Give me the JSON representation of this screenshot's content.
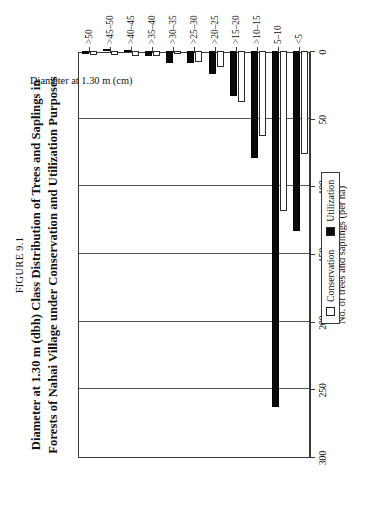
{
  "figure": {
    "number_prefix": "F",
    "number_rest": "IGURE",
    "number_label": "FIGURE 9.1",
    "number_text": "9.1",
    "title_line1": "Diameter at 1.30 m (dbh) Class Distribution of Trees and Saplings in",
    "title_line2": "Forests of Nahai Village under Conservation and Utilization Purposes"
  },
  "legend": {
    "position": "bottom-center",
    "items": [
      {
        "label": "Conservation",
        "color": "#ffffff"
      },
      {
        "label": "Utilization",
        "color": "#0a0a0a"
      }
    ]
  },
  "axes": {
    "value_axis_title": "No. of trees and saplings (per ha)",
    "category_axis_title": "Diameter at 1.30 m (cm)",
    "value_ticks": [
      "0",
      "50",
      "100",
      "150",
      "200",
      "250",
      "300"
    ]
  },
  "chart_data": {
    "type": "bar",
    "orientation": "horizontal",
    "title": "Diameter at 1.30 m (dbh) Class Distribution of Trees and Saplings in Forests of Nahai Village under Conservation and Utilization Purposes",
    "subtitle": "FIGURE 9.1",
    "xlabel": "Diameter at 1.30 m (cm)",
    "ylabel": "No. of trees and saplings (per ha)",
    "ylim": [
      0,
      300
    ],
    "ytick_step": 50,
    "grid": true,
    "legend_entries": [
      "Conservation",
      "Utilization"
    ],
    "categories": [
      "<5",
      "5–10",
      ">10–15",
      ">15–20",
      ">20–25",
      ">25–30",
      ">30–35",
      ">35–40",
      ">40–45",
      ">45–50",
      ">50"
    ],
    "series": [
      {
        "name": "Conservation",
        "color": "#ffffff",
        "values": [
          76,
          118,
          63,
          38,
          12,
          8,
          2,
          4,
          4,
          3,
          3
        ]
      },
      {
        "name": "Utilization",
        "color": "#0a0a0a",
        "values": [
          133,
          263,
          79,
          33,
          17,
          9,
          9,
          4,
          1,
          0,
          2
        ]
      }
    ]
  }
}
